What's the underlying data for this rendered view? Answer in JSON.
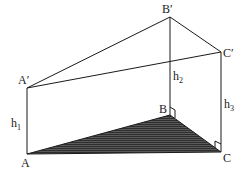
{
  "diagram": {
    "title": "",
    "vertices": {
      "A": {
        "label": "A",
        "x": 27,
        "y": 154
      },
      "B": {
        "label": "B",
        "x": 170,
        "y": 115
      },
      "C": {
        "label": "C",
        "x": 221,
        "y": 152
      },
      "A'": {
        "label": "A′",
        "x": 27,
        "y": 88
      },
      "B'": {
        "label": "B′",
        "x": 170,
        "y": 17
      },
      "C'": {
        "label": "C′",
        "x": 221,
        "y": 52
      }
    },
    "heights": [
      {
        "name": "h",
        "sub": "1"
      },
      {
        "name": "h",
        "sub": "2"
      },
      {
        "name": "h",
        "sub": "3"
      }
    ],
    "base_fill": "#4a4a4a",
    "line_color": "#1a1a1a"
  }
}
